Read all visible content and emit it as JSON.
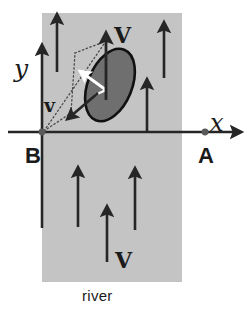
{
  "figure": {
    "background_color": "#ffffff",
    "river_band": {
      "label": "river",
      "fill_color": "#c4c4c4",
      "x": 42,
      "y": 13,
      "width": 140,
      "height": 269
    },
    "axes": {
      "x_label": "x",
      "y_label": "y",
      "axis_color": "#262626",
      "origin_x": 42,
      "origin_y": 132,
      "x_axis_end": 238,
      "y_axis_top": 48
    },
    "points": [
      {
        "name": "B",
        "label": "B",
        "x": 42,
        "y": 132,
        "marker_color": "#555555"
      },
      {
        "name": "A",
        "label": "A",
        "x": 205,
        "y": 132,
        "marker_color": "#555555"
      }
    ],
    "boat": {
      "name": "boat-ellipse",
      "fill_color": "#6f6f6f",
      "stroke_color": "#111111",
      "center_x": 110,
      "center_y": 85,
      "radius_x": 22,
      "radius_y": 38,
      "rotation_deg": 22,
      "heading_arrow_color": "#ffffff"
    },
    "vectors": [
      {
        "name": "boat-velocity-V",
        "label": "V",
        "style": "bold-serif",
        "description": "resultant velocity arrow pointing up from boat",
        "color": "#262626"
      },
      {
        "name": "river-velocity-v",
        "label": "v",
        "style": "bold-serif",
        "description": "relative velocity arrow pointing down-left",
        "color": "#262626"
      },
      {
        "name": "river-current-V",
        "label": "V",
        "style": "bold-serif",
        "description": "river current label near bottom arrow",
        "color": "#262626"
      }
    ],
    "current_arrows": {
      "name": "river-current-arrows",
      "color": "#262626",
      "count": 6,
      "direction": "up"
    },
    "construction_lines": {
      "name": "dotted-parallelogram",
      "style": "dotted",
      "color": "#4a4a4a"
    },
    "colors": {
      "river": "#c4c4c4",
      "boat_fill": "#6f6f6f",
      "ink": "#262626",
      "page": "#ffffff"
    }
  }
}
